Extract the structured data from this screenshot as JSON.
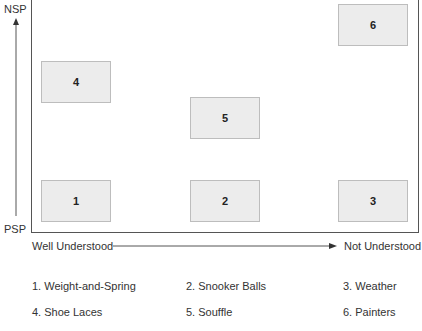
{
  "axes": {
    "y_top_label": "NSP",
    "y_bottom_label": "PSP",
    "x_left_label": "Well Understood",
    "x_right_label": "Not Understood"
  },
  "boxes": [
    {
      "id": "1",
      "label": "1",
      "col": "left",
      "row": "bottom"
    },
    {
      "id": "2",
      "label": "2",
      "col": "middle",
      "row": "bottom"
    },
    {
      "id": "3",
      "label": "3",
      "col": "right",
      "row": "bottom"
    },
    {
      "id": "4",
      "label": "4",
      "col": "left",
      "row": "upper-middle"
    },
    {
      "id": "5",
      "label": "5",
      "col": "middle",
      "row": "middle"
    },
    {
      "id": "6",
      "label": "6",
      "col": "right",
      "row": "top"
    }
  ],
  "legend": [
    "1. Weight-and-Spring",
    "2. Snooker Balls",
    "3. Weather",
    "4. Shoe Laces",
    "5. Souffle",
    "6. Painters"
  ],
  "colors": {
    "box_fill": "#ececec",
    "box_border": "#bdbdbd",
    "line": "#555555",
    "text": "#333333"
  }
}
